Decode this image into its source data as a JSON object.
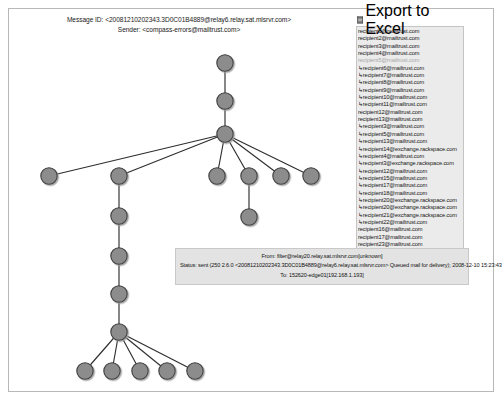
{
  "header": {
    "message_id_line": "Message ID: <20081210202343.3D0C01B4889@relay6.relay.sat.mlsrvr.com>",
    "sender_line": "Sender: <compass-errors@mailtrust.com>"
  },
  "recipients_panel": {
    "export_label": "Export to Excel",
    "export_icon": "excel-spreadsheet-icon",
    "items": [
      {
        "address": "recipient1@mailtrust.com",
        "arrow": false,
        "dim": false
      },
      {
        "address": "recipient2@mailtrust.com",
        "arrow": false,
        "dim": false
      },
      {
        "address": "recipient3@mailtrust.com",
        "arrow": false,
        "dim": false
      },
      {
        "address": "recipient4@mailtrust.com",
        "arrow": false,
        "dim": false
      },
      {
        "address": "recipient5@mailtrust.com",
        "arrow": false,
        "dim": true
      },
      {
        "address": "recipient6@mailtrust.com",
        "arrow": true,
        "dim": false
      },
      {
        "address": "recipient7@mailtrust.com",
        "arrow": true,
        "dim": false
      },
      {
        "address": "recipient8@mailtrust.com",
        "arrow": true,
        "dim": false
      },
      {
        "address": "recipient9@mailtrust.com",
        "arrow": true,
        "dim": false
      },
      {
        "address": "recipient10@mailtrust.com",
        "arrow": true,
        "dim": false
      },
      {
        "address": "recipient11@mailtrust.com",
        "arrow": true,
        "dim": false
      },
      {
        "address": "recipient12@mailtrust.com",
        "arrow": false,
        "dim": false
      },
      {
        "address": "recipient13@mailtrust.com",
        "arrow": false,
        "dim": false
      },
      {
        "address": "recipient3@mailtrust.com",
        "arrow": true,
        "dim": false
      },
      {
        "address": "recipient5@mailtrust.com",
        "arrow": true,
        "dim": false
      },
      {
        "address": "recipient13@mailtrust.com",
        "arrow": true,
        "dim": false
      },
      {
        "address": "recipient14@exchange.rackspace.com",
        "arrow": true,
        "dim": false
      },
      {
        "address": "recipient4@mailtrust.com",
        "arrow": true,
        "dim": false
      },
      {
        "address": "recipient3@exchange.rackspace.com",
        "arrow": true,
        "dim": false
      },
      {
        "address": "recipient12@mailtrust.com",
        "arrow": true,
        "dim": false
      },
      {
        "address": "recipient15@mailtrust.com",
        "arrow": true,
        "dim": false
      },
      {
        "address": "recipient17@mailtrust.com",
        "arrow": true,
        "dim": false
      },
      {
        "address": "recipient18@mailtrust.com",
        "arrow": true,
        "dim": false
      },
      {
        "address": "recipient20@exchange.rackspace.com",
        "arrow": true,
        "dim": false
      },
      {
        "address": "recipient20@exchange.rackspace.com",
        "arrow": true,
        "dim": false
      },
      {
        "address": "recipient21@exchange.rackspace.com",
        "arrow": true,
        "dim": false
      },
      {
        "address": "recipient22@mailtrust.com",
        "arrow": true,
        "dim": false
      },
      {
        "address": "recipient16@mailtrust.com",
        "arrow": false,
        "dim": false
      },
      {
        "address": "recipient17@mailtrust.com",
        "arrow": false,
        "dim": false
      },
      {
        "address": "recipient23@mailtrust.com",
        "arrow": false,
        "dim": false
      },
      {
        "address": "recipient19@mailtrust.com",
        "arrow": false,
        "dim": false
      },
      {
        "address": "recipient24@mailtrust.com",
        "arrow": false,
        "dim": false
      },
      {
        "address": "recipient22@mailtrust.com",
        "arrow": false,
        "dim": false
      }
    ]
  },
  "detail_box": {
    "from_line": "From: filter@relay20.relay.sat.mlsrvr.com[unknown]",
    "status_line": "Status: sent (250 2.6.0 <20081210202343.3D0C01B4889@relay6.relay.sat.mlsrvr.com> Queued mail for delivery); 2008-12-10 15:23:43",
    "to_line": "To: 152620-edge01[192.168.1.193]"
  },
  "graph": {
    "node_fill": "#8c8c8c",
    "node_stroke": "#3c3c3c",
    "edge_color": "#2e2e2e",
    "node_radius": 8.2,
    "nodes": [
      {
        "id": "n0",
        "x": 216,
        "y": 54,
        "name": "root-node"
      },
      {
        "id": "n1",
        "x": 216,
        "y": 92,
        "name": "relay-node"
      },
      {
        "id": "n2",
        "x": 216,
        "y": 125,
        "name": "hub-node"
      },
      {
        "id": "n3",
        "x": 40,
        "y": 167,
        "name": "leaf-node"
      },
      {
        "id": "n4",
        "x": 110,
        "y": 167,
        "name": "branch-node"
      },
      {
        "id": "n5",
        "x": 208,
        "y": 167,
        "name": "leaf-node"
      },
      {
        "id": "n6",
        "x": 240,
        "y": 167,
        "name": "branch-node"
      },
      {
        "id": "n7",
        "x": 272,
        "y": 167,
        "name": "leaf-node"
      },
      {
        "id": "n8",
        "x": 302,
        "y": 167,
        "name": "leaf-node"
      },
      {
        "id": "n9",
        "x": 240,
        "y": 208,
        "name": "leaf-node"
      },
      {
        "id": "n10",
        "x": 110,
        "y": 207,
        "name": "chain-node"
      },
      {
        "id": "n11",
        "x": 110,
        "y": 247,
        "name": "chain-node"
      },
      {
        "id": "n12",
        "x": 110,
        "y": 285,
        "name": "chain-node"
      },
      {
        "id": "n13",
        "x": 110,
        "y": 323,
        "name": "fanout-node"
      },
      {
        "id": "n14",
        "x": 76,
        "y": 362,
        "name": "leaf-node"
      },
      {
        "id": "n15",
        "x": 103,
        "y": 362,
        "name": "leaf-node"
      },
      {
        "id": "n16",
        "x": 131,
        "y": 362,
        "name": "leaf-node"
      },
      {
        "id": "n17",
        "x": 158,
        "y": 362,
        "name": "leaf-node"
      },
      {
        "id": "n18",
        "x": 186,
        "y": 362,
        "name": "leaf-node"
      }
    ],
    "edges": [
      [
        "n0",
        "n1"
      ],
      [
        "n1",
        "n2"
      ],
      [
        "n2",
        "n3"
      ],
      [
        "n2",
        "n4"
      ],
      [
        "n2",
        "n5"
      ],
      [
        "n2",
        "n6"
      ],
      [
        "n2",
        "n7"
      ],
      [
        "n2",
        "n8"
      ],
      [
        "n6",
        "n9"
      ],
      [
        "n4",
        "n10"
      ],
      [
        "n10",
        "n11"
      ],
      [
        "n11",
        "n12"
      ],
      [
        "n12",
        "n13"
      ],
      [
        "n13",
        "n14"
      ],
      [
        "n13",
        "n15"
      ],
      [
        "n13",
        "n16"
      ],
      [
        "n13",
        "n17"
      ],
      [
        "n13",
        "n18"
      ]
    ]
  }
}
